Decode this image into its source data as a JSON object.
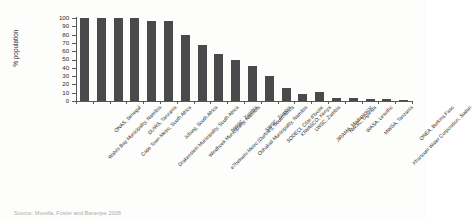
{
  "chart_data": {
    "type": "bar",
    "title": "",
    "xlabel": "",
    "ylabel": "% population",
    "ylim": [
      0,
      100
    ],
    "yticks": [
      0,
      10,
      20,
      30,
      40,
      50,
      60,
      70,
      80,
      90,
      100
    ],
    "grid": false,
    "legend": null,
    "bar_color": "#4a4a4c",
    "categories": [
      "Walvis Bay Municipality, Namibia",
      "ONAS, Senegal",
      "Cape Town Metro, South Africa",
      "DUWS, Tanzania",
      "Drakenstein Municipality, South Africa",
      "Joburg, South Africa",
      "Windhoek Municipality, Namibia",
      "eThekwini Metro (Durban), South Africa",
      "NWSC, Zambia",
      "Oshakati Municipality, Namibia",
      "SWSC, Zambia",
      "SODECI, Côte d'Ivoire",
      "KIWASCO, Kenya",
      "LWSC, Zambia",
      "JIRAMA, Madagascar",
      "NWSC, Uganda",
      "WASA, Lesotho",
      "MWSA, Tanzania",
      "Khartoum Water Corporation, Sudan",
      "ONEA, Burkina Faso"
    ],
    "values": [
      100,
      100,
      100,
      100,
      96,
      96,
      79,
      68,
      57,
      50,
      42,
      30,
      16,
      9,
      11,
      4,
      4,
      3,
      3,
      1
    ]
  },
  "caption": {
    "source": "Source: Morella, Foster and Banerjee 2008"
  }
}
